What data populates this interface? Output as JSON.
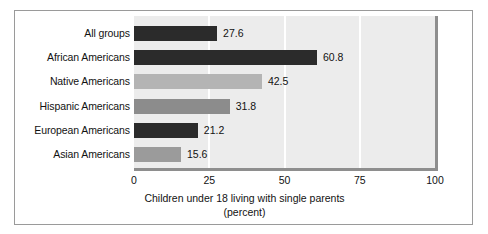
{
  "chart_data": {
    "type": "bar",
    "orientation": "horizontal",
    "title": "",
    "xlabel": "Children under 18 living with single parents (percent)",
    "xlabel_lines": [
      "Children under 18 living with single parents",
      "(percent)"
    ],
    "ylabel": "",
    "categories": [
      "All groups",
      "African Americans",
      "Native Americans",
      "Hispanic Americans",
      "European Americans",
      "Asian Americans"
    ],
    "values": [
      27.6,
      60.8,
      42.5,
      31.8,
      21.2,
      15.6
    ],
    "value_labels": [
      "27.6",
      "60.8",
      "42.5",
      "31.8",
      "21.2",
      "15.6"
    ],
    "bar_colors": [
      "#2b2b2b",
      "#2b2b2b",
      "#b4b4b4",
      "#8c8c8c",
      "#2b2b2b",
      "#9b9b9b"
    ],
    "xlim": [
      0,
      100
    ],
    "xticks": [
      0,
      25,
      50,
      75,
      100
    ],
    "xtick_labels": [
      "0",
      "25",
      "50",
      "75",
      "100"
    ],
    "grid": true,
    "gridline_color": "#ffffff",
    "plot_background": "#ececec",
    "legend": null
  },
  "figure": {
    "border_color": "#9a9a9a",
    "background": "#ffffff",
    "shadow_color": "#8e8e8e"
  }
}
